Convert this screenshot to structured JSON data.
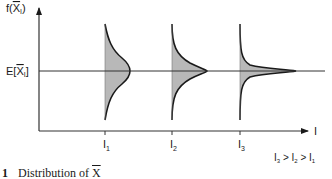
{
  "diagram": {
    "y_axis_label_prefix": "f(",
    "y_axis_label_var": "X",
    "y_axis_label_sub": "I",
    "y_axis_label_suffix": ")",
    "mean_label_prefix": "E[",
    "mean_label_var": "X",
    "mean_label_sub": "I",
    "mean_label_suffix": "]",
    "x_axis_label": "I",
    "ticks": [
      {
        "label": "I",
        "sub": "1"
      },
      {
        "label": "I",
        "sub": "2"
      },
      {
        "label": "I",
        "sub": "3"
      }
    ],
    "inequality": {
      "parts": [
        "I",
        "3",
        " > ",
        "I",
        "2",
        " > ",
        "I",
        "1"
      ]
    },
    "colors": {
      "ink": "#1a1a1a",
      "fill": "#b8b8b8",
      "axis": "#333333"
    }
  },
  "caption": {
    "number": "1",
    "text": "Distribution of ",
    "var": "X"
  }
}
